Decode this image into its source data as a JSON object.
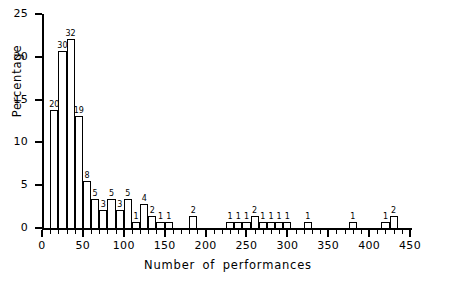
{
  "chart_data": {
    "type": "bar",
    "title": "",
    "xlabel": "Number of performances",
    "ylabel": "Percentage",
    "xlim": [
      0,
      450
    ],
    "ylim": [
      0,
      25
    ],
    "bin_width": 10,
    "grid": false,
    "legend": null,
    "y_ticks": [
      0,
      5,
      10,
      15,
      20,
      25
    ],
    "y_tick_labels": [
      "0",
      "5",
      "10",
      "15",
      "20",
      "25"
    ],
    "x_ticks": [
      0,
      50,
      100,
      150,
      200,
      250,
      300,
      350,
      400,
      450
    ],
    "x_tick_labels": [
      "0",
      "50",
      "100",
      "150",
      "200",
      "250",
      "300",
      "350",
      "400",
      "450"
    ],
    "value_units": "percentage",
    "label_units": "count",
    "total_count": 145,
    "bins": [
      {
        "x0": 10,
        "x1": 20,
        "count": 20,
        "percent": 13.8,
        "label": "20"
      },
      {
        "x0": 20,
        "x1": 30,
        "count": 30,
        "percent": 20.7,
        "label": "30"
      },
      {
        "x0": 30,
        "x1": 40,
        "count": 32,
        "percent": 22.1,
        "label": "32"
      },
      {
        "x0": 40,
        "x1": 50,
        "count": 19,
        "percent": 13.1,
        "label": "19"
      },
      {
        "x0": 50,
        "x1": 60,
        "count": 8,
        "percent": 5.5,
        "label": "8"
      },
      {
        "x0": 60,
        "x1": 70,
        "count": 5,
        "percent": 3.4,
        "label": "5"
      },
      {
        "x0": 70,
        "x1": 80,
        "count": 3,
        "percent": 2.1,
        "label": "3"
      },
      {
        "x0": 80,
        "x1": 90,
        "count": 5,
        "percent": 3.4,
        "label": "5"
      },
      {
        "x0": 90,
        "x1": 100,
        "count": 3,
        "percent": 2.1,
        "label": "3"
      },
      {
        "x0": 100,
        "x1": 110,
        "count": 5,
        "percent": 3.4,
        "label": "5"
      },
      {
        "x0": 110,
        "x1": 120,
        "count": 1,
        "percent": 0.7,
        "label": "1"
      },
      {
        "x0": 120,
        "x1": 130,
        "count": 4,
        "percent": 2.8,
        "label": "4"
      },
      {
        "x0": 130,
        "x1": 140,
        "count": 2,
        "percent": 1.4,
        "label": "2"
      },
      {
        "x0": 140,
        "x1": 150,
        "count": 1,
        "percent": 0.7,
        "label": "1"
      },
      {
        "x0": 150,
        "x1": 160,
        "count": 1,
        "percent": 0.7,
        "label": "1"
      },
      {
        "x0": 180,
        "x1": 190,
        "count": 2,
        "percent": 1.4,
        "label": "2"
      },
      {
        "x0": 225,
        "x1": 235,
        "count": 1,
        "percent": 0.7,
        "label": "1"
      },
      {
        "x0": 235,
        "x1": 245,
        "count": 1,
        "percent": 0.7,
        "label": "1"
      },
      {
        "x0": 245,
        "x1": 255,
        "count": 1,
        "percent": 0.7,
        "label": "1"
      },
      {
        "x0": 255,
        "x1": 265,
        "count": 2,
        "percent": 1.4,
        "label": "2"
      },
      {
        "x0": 265,
        "x1": 275,
        "count": 1,
        "percent": 0.7,
        "label": "1"
      },
      {
        "x0": 275,
        "x1": 285,
        "count": 1,
        "percent": 0.7,
        "label": "1"
      },
      {
        "x0": 285,
        "x1": 295,
        "count": 1,
        "percent": 0.7,
        "label": "1"
      },
      {
        "x0": 295,
        "x1": 305,
        "count": 1,
        "percent": 0.7,
        "label": "1"
      },
      {
        "x0": 320,
        "x1": 330,
        "count": 1,
        "percent": 0.7,
        "label": "1"
      },
      {
        "x0": 375,
        "x1": 385,
        "count": 1,
        "percent": 0.7,
        "label": "1"
      },
      {
        "x0": 415,
        "x1": 425,
        "count": 1,
        "percent": 0.7,
        "label": "1"
      },
      {
        "x0": 425,
        "x1": 435,
        "count": 2,
        "percent": 1.4,
        "label": "2"
      }
    ]
  }
}
